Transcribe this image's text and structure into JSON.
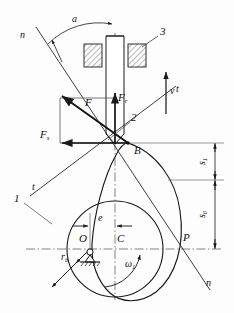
{
  "figure": {
    "type": "cam-mechanism-force-diagram"
  },
  "labels": {
    "pressure_angle": "a",
    "normal_line_top": "n",
    "normal_line_bottom": "n",
    "tangent_line_right": "t",
    "tangent_line_left": "t",
    "frame": "3",
    "follower": "2",
    "cam": "1",
    "contact_point": "B",
    "velocity": "v",
    "force_total": "F",
    "force_radial": "F",
    "force_radial_sub": "r",
    "force_side": "F",
    "force_side_sub": "s",
    "center_pivot": "O",
    "cam_center": "C",
    "pitch_point": "P",
    "offset": "e",
    "base_radius": "r",
    "base_radius_sub": "b",
    "angular_velocity": "ω",
    "angular_velocity_sub": "1",
    "stroke_upper": "s",
    "stroke_upper_sub": "1",
    "stroke_lower": "s",
    "stroke_lower_sub": "0"
  },
  "colors": {
    "line": "#1a1a1a",
    "thin": "#3a3a3a",
    "center": "#4a4a4a",
    "hatch": "#555555",
    "background": "#fdfdfd"
  },
  "geometry": {
    "contact_point_B": [
      128,
      143
    ],
    "pivot_O": [
      90,
      249
    ],
    "cam_center_C": [
      115,
      249
    ],
    "pitch_point_P": [
      186,
      249
    ],
    "offset_e_px": 25,
    "base_circle_radius_px": 48,
    "stroke_s1_px": 36,
    "stroke_s0_px": 67
  }
}
